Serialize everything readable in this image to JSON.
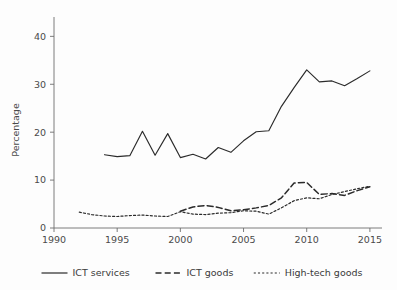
{
  "chart_data": {
    "type": "line",
    "title": "",
    "xlabel": "",
    "ylabel": "Percentage",
    "xlim": [
      1990,
      2015.8
    ],
    "ylim": [
      0,
      43
    ],
    "grid": false,
    "legend_position": "bottom",
    "xticks": [
      1990,
      1995,
      2000,
      2005,
      2010,
      2015
    ],
    "xtick_labels": [
      "1990",
      "1995",
      "2000",
      "2005",
      "2010",
      "2015"
    ],
    "yticks": [
      0,
      10,
      20,
      30,
      40
    ],
    "ytick_labels": [
      "0",
      "10",
      "20",
      "30",
      "40"
    ],
    "series": [
      {
        "name": "ICT services",
        "style": "solid",
        "x": [
          1994,
          1995,
          1996,
          1997,
          1998,
          1999,
          2000,
          2001,
          2002,
          2003,
          2004,
          2005,
          2006,
          2007,
          2008,
          2009,
          2010,
          2011,
          2012,
          2013,
          2014,
          2015
        ],
        "values": [
          15.3,
          14.9,
          15.1,
          20.2,
          15.2,
          19.7,
          14.7,
          15.4,
          14.4,
          16.8,
          15.8,
          18.2,
          20.1,
          20.3,
          25.4,
          29.3,
          33.0,
          30.5,
          30.7,
          29.7,
          31.2,
          32.8
        ]
      },
      {
        "name": "ICT goods",
        "style": "dashed",
        "x": [
          2000,
          2001,
          2002,
          2003,
          2004,
          2005,
          2006,
          2007,
          2008,
          2009,
          2010,
          2011,
          2012,
          2013,
          2014,
          2015
        ],
        "values": [
          3.5,
          4.4,
          4.7,
          4.3,
          3.6,
          3.8,
          4.2,
          4.7,
          6.3,
          9.4,
          9.5,
          7.0,
          7.2,
          6.8,
          7.8,
          8.6
        ]
      },
      {
        "name": "High-tech goods",
        "style": "dotted",
        "x": [
          1992,
          1993,
          1994,
          1995,
          1996,
          1997,
          1998,
          1999,
          2000,
          2001,
          2002,
          2003,
          2004,
          2005,
          2006,
          2007,
          2008,
          2009,
          2010,
          2011,
          2012,
          2013,
          2014,
          2015
        ],
        "values": [
          3.3,
          2.8,
          2.5,
          2.4,
          2.6,
          2.7,
          2.5,
          2.4,
          3.4,
          2.9,
          2.8,
          3.1,
          3.2,
          3.6,
          3.5,
          2.9,
          4.2,
          5.7,
          6.3,
          6.1,
          7.0,
          7.6,
          8.2,
          8.7
        ]
      }
    ]
  },
  "legend": {
    "items": [
      {
        "label": "ICT services",
        "style": "solid"
      },
      {
        "label": "ICT goods",
        "style": "dashed"
      },
      {
        "label": "High-tech goods",
        "style": "dotted"
      }
    ]
  },
  "colors": {
    "line": "#2b2b2b",
    "axis": "#6e6e6e",
    "text": "#3a3a3a",
    "background": "#fdfdfd"
  }
}
